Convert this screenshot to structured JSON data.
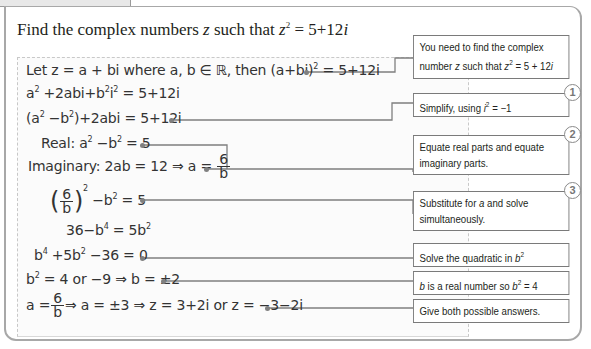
{
  "title": {
    "prefix": "Find the complex numbers ",
    "var": "z",
    "middle": " such that ",
    "var2": "z",
    "exp": "2",
    "rhs": " = 5+12",
    "i": "i"
  },
  "steps": [
    {
      "id": "let",
      "text_a": "Let z = a + bi where a, b ∈ ℝ, then (a+bi)",
      "sup": "2",
      "text_b": " = 5+12i"
    },
    {
      "id": "expand",
      "text_a": "a",
      "sup1": "2",
      "text_b": " +2abi+b",
      "sup2": "2",
      "text_c": "i",
      "sup3": "2",
      "text_d": " = 5+12i"
    },
    {
      "id": "group",
      "text_a": "(a",
      "sup1": "2",
      "text_b": " −b",
      "sup2": "2",
      "text_c": ")+2abi = 5+12i"
    },
    {
      "id": "real",
      "text_a": "Real: a",
      "sup1": "2",
      "text_b": " −b",
      "sup2": "2",
      "text_c": " = 5"
    },
    {
      "id": "imaginary",
      "text_a": "Imaginary: 2ab = 12 ⇒ a =",
      "num": "6",
      "den": "b"
    },
    {
      "id": "substitute",
      "open": "(",
      "num": "6",
      "den": "b",
      "close": ")",
      "sup1": "2",
      "text_b": " −b",
      "sup2": "2",
      "text_c": " = 5"
    },
    {
      "id": "rearrange",
      "text_a": "36−b",
      "sup1": "4",
      "text_b": " = 5b",
      "sup2": "2"
    },
    {
      "id": "quadratic",
      "text_a": "b",
      "sup1": "4",
      "text_b": " +5b",
      "sup2": "2",
      "text_c": " −36 = 0"
    },
    {
      "id": "roots",
      "text_a": "b",
      "sup1": "2",
      "text_b": " = 4 or −9 ⇒ b = ±2"
    },
    {
      "id": "answer",
      "text_a": "a =",
      "num": "6",
      "den": "b",
      "text_b": "⇒ a = ±3 ⇒ z = 3+2i or z = −3−2i"
    }
  ],
  "notes": [
    {
      "id": "note-find",
      "line1": "You need to find the complex",
      "line2a": "number ",
      "line2var": "z",
      "line2b": " such that ",
      "line2var2": "z",
      "line2sup": "2",
      "line2c": " = 5 + 12",
      "line2i": "i"
    },
    {
      "id": "note-simplify",
      "text_a": "Simplify, using ",
      "var": "i",
      "sup": "2",
      "text_b": " = −1",
      "badge": "1"
    },
    {
      "id": "note-equate",
      "line1": "Equate real parts and equate",
      "line2": "imaginary parts.",
      "badge": "2"
    },
    {
      "id": "note-substitute",
      "line1a": "Substitute for ",
      "var": "a",
      "line1b": " and solve",
      "line2": "simultaneously.",
      "badge": "3"
    },
    {
      "id": "note-quadratic",
      "text_a": "Solve the quadratic in ",
      "var": "b",
      "sup": "2"
    },
    {
      "id": "note-real",
      "var": "b",
      "text_a": " is a real number so ",
      "var2": "b",
      "sup": "2",
      "text_b": " = 4"
    },
    {
      "id": "note-answers",
      "text": "Give both possible answers."
    }
  ]
}
